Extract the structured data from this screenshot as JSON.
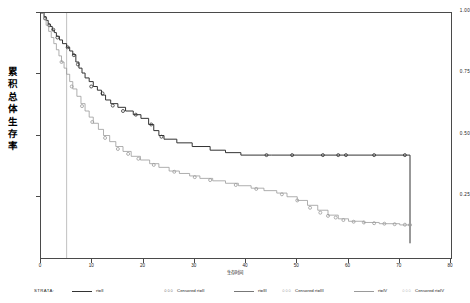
{
  "chart_data": {
    "type": "line",
    "subtype": "kaplan-meier-survival",
    "title": "",
    "xlabel": "生存时间",
    "ylabel": "累积总体生存率",
    "xlim": [
      0,
      80
    ],
    "ylim": [
      0.0,
      1.0
    ],
    "xticks": [
      0,
      10,
      20,
      30,
      40,
      50,
      60,
      70,
      80
    ],
    "xtick_labels": [
      "0",
      "10",
      "20",
      "30",
      "40",
      "50",
      "60",
      "70",
      "80"
    ],
    "yticks": [
      0.25,
      0.5,
      0.75,
      1.0
    ],
    "ytick_labels": [
      "0.25",
      "0.50",
      "0.75",
      "1.00"
    ],
    "grid": false,
    "legend_position": "bottom",
    "reference_line_x": 5,
    "series": [
      {
        "name": "rt=III",
        "color": "#333333",
        "style": "step",
        "points": [
          [
            0,
            1.0
          ],
          [
            0.6,
            0.985
          ],
          [
            1.0,
            0.97
          ],
          [
            1.4,
            0.955
          ],
          [
            1.8,
            0.945
          ],
          [
            2.2,
            0.93
          ],
          [
            2.6,
            0.92
          ],
          [
            3.0,
            0.905
          ],
          [
            3.6,
            0.89
          ],
          [
            4.2,
            0.875
          ],
          [
            5.0,
            0.86
          ],
          [
            5.6,
            0.845
          ],
          [
            6.2,
            0.83
          ],
          [
            6.8,
            0.8
          ],
          [
            7.4,
            0.775
          ],
          [
            8.0,
            0.755
          ],
          [
            8.6,
            0.735
          ],
          [
            9.4,
            0.72
          ],
          [
            10.2,
            0.7
          ],
          [
            11.0,
            0.685
          ],
          [
            11.8,
            0.665
          ],
          [
            12.6,
            0.645
          ],
          [
            13.6,
            0.63
          ],
          [
            15.0,
            0.615
          ],
          [
            16.5,
            0.6
          ],
          [
            18.0,
            0.585
          ],
          [
            19.5,
            0.57
          ],
          [
            21.0,
            0.545
          ],
          [
            22.0,
            0.52
          ],
          [
            23.0,
            0.5
          ],
          [
            24.0,
            0.485
          ],
          [
            26.5,
            0.47
          ],
          [
            29.5,
            0.455
          ],
          [
            33.0,
            0.44
          ],
          [
            36.0,
            0.43
          ],
          [
            39.0,
            0.42
          ],
          [
            45.0,
            0.42
          ],
          [
            55.0,
            0.42
          ],
          [
            65.0,
            0.42
          ],
          [
            72.0,
            0.42
          ],
          [
            72.0,
            0.06
          ]
        ],
        "censored_x": [
          0.8,
          1.6,
          2.4,
          3.2,
          5.2,
          6.4,
          7.2,
          9.8,
          12.0,
          14.0,
          16.0,
          18.5,
          21.5,
          23.5,
          44.0,
          49.0,
          55.0,
          58.0,
          59.5,
          65.0,
          71.0
        ],
        "censored_y": [
          0.978,
          0.95,
          0.932,
          0.9,
          0.86,
          0.828,
          0.79,
          0.7,
          0.672,
          0.622,
          0.6,
          0.585,
          0.545,
          0.495,
          0.42,
          0.42,
          0.42,
          0.42,
          0.42,
          0.42,
          0.42
        ]
      },
      {
        "name": "rt=II",
        "color": "#9a9a9a",
        "style": "step",
        "points": [
          [
            0,
            1.0
          ],
          [
            0.5,
            0.975
          ],
          [
            1.0,
            0.95
          ],
          [
            1.5,
            0.925
          ],
          [
            2.0,
            0.9
          ],
          [
            2.5,
            0.875
          ],
          [
            3.0,
            0.85
          ],
          [
            3.5,
            0.825
          ],
          [
            4.0,
            0.8
          ],
          [
            4.5,
            0.775
          ],
          [
            5.0,
            0.75
          ],
          [
            5.6,
            0.72
          ],
          [
            6.2,
            0.69
          ],
          [
            7.0,
            0.66
          ],
          [
            7.8,
            0.63
          ],
          [
            8.6,
            0.6
          ],
          [
            9.4,
            0.575
          ],
          [
            10.2,
            0.55
          ],
          [
            11.2,
            0.525
          ],
          [
            12.2,
            0.5
          ],
          [
            13.4,
            0.475
          ],
          [
            14.6,
            0.455
          ],
          [
            16.0,
            0.435
          ],
          [
            17.6,
            0.415
          ],
          [
            19.4,
            0.4
          ],
          [
            21.2,
            0.385
          ],
          [
            23.0,
            0.37
          ],
          [
            25.0,
            0.355
          ],
          [
            27.0,
            0.345
          ],
          [
            29.0,
            0.335
          ],
          [
            31.0,
            0.325
          ],
          [
            33.5,
            0.315
          ],
          [
            36.0,
            0.305
          ],
          [
            38.5,
            0.295
          ],
          [
            41.0,
            0.285
          ],
          [
            43.5,
            0.275
          ],
          [
            46.0,
            0.265
          ],
          [
            48.0,
            0.25
          ],
          [
            50.0,
            0.235
          ],
          [
            52.0,
            0.215
          ],
          [
            54.0,
            0.195
          ],
          [
            56.0,
            0.175
          ],
          [
            58.0,
            0.16
          ],
          [
            60.0,
            0.15
          ],
          [
            63.0,
            0.145
          ],
          [
            66.0,
            0.14
          ],
          [
            70.0,
            0.135
          ],
          [
            72.0,
            0.135
          ]
        ],
        "censored_x": [
          4.0,
          6.0,
          8.0,
          10.0,
          12.5,
          15.0,
          17.0,
          19.0,
          22.0,
          26.0,
          30.0,
          33.0,
          38.0,
          42.0,
          47.0,
          50.0,
          52.5,
          54.5,
          56.0,
          57.5,
          59.0,
          61.0,
          63.0,
          65.0,
          67.0,
          69.0,
          71.0,
          72.0
        ],
        "censored_y": [
          0.8,
          0.7,
          0.62,
          0.555,
          0.49,
          0.445,
          0.425,
          0.405,
          0.38,
          0.352,
          0.33,
          0.318,
          0.298,
          0.282,
          0.26,
          0.235,
          0.205,
          0.185,
          0.172,
          0.165,
          0.155,
          0.148,
          0.145,
          0.142,
          0.14,
          0.138,
          0.136,
          0.135
        ]
      }
    ]
  },
  "yaxis": {
    "title_chars": [
      "累",
      "积",
      "总",
      "体",
      "生",
      "存",
      "率"
    ],
    "ticks": [
      {
        "value": "1.00",
        "pos": 1.0
      },
      {
        "value": "0.75",
        "pos": 0.75
      },
      {
        "value": "0.50",
        "pos": 0.5
      },
      {
        "value": "0.25",
        "pos": 0.25
      }
    ]
  },
  "xaxis": {
    "title": "生存时间",
    "ticks": [
      {
        "label": "0",
        "value": 0
      },
      {
        "label": "10",
        "value": 10
      },
      {
        "label": "20",
        "value": 20
      },
      {
        "label": "30",
        "value": 30
      },
      {
        "label": "40",
        "value": 40
      },
      {
        "label": "50",
        "value": 50
      },
      {
        "label": "60",
        "value": 60
      },
      {
        "label": "70",
        "value": 70
      },
      {
        "label": "80",
        "value": 80
      }
    ]
  },
  "legend": {
    "title": "STRATA:",
    "items": [
      {
        "kind": "line",
        "marker": "",
        "label": "rt=II",
        "x": 36
      },
      {
        "kind": "censored",
        "marker": "○○○",
        "label": "Censored rt=II",
        "x": 130
      },
      {
        "kind": "line",
        "marker": "",
        "label": "rt=III",
        "x": 198
      },
      {
        "kind": "censored",
        "marker": "○○○",
        "label": "Censored rt=III",
        "x": 248
      },
      {
        "kind": "line",
        "marker": "",
        "label": "rt=IV",
        "x": 318
      },
      {
        "kind": "censored",
        "marker": "○○○",
        "label": "Censored rt=IV",
        "x": 368
      }
    ]
  }
}
